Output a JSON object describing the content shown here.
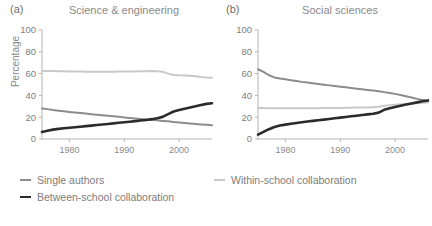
{
  "figure": {
    "background": "#ffffff",
    "axis_color": "#b4b4b4",
    "text_color": "#7e7e7e"
  },
  "legend": {
    "position": "below",
    "items": [
      {
        "label": "Single authors",
        "color": "#8c8c8c",
        "width": 2.0,
        "swatch": "line-swatch-single-authors"
      },
      {
        "label": "Within-school collaboration",
        "color": "#c9c9c9",
        "width": 2.0,
        "swatch": "line-swatch-within-school"
      },
      {
        "label": "Between-school collaboration",
        "color": "#2b2b2b",
        "width": 2.6,
        "swatch": "line-swatch-between-school"
      }
    ]
  },
  "chart_data": [
    {
      "type": "line",
      "panel_tag": "(a)",
      "title": "Science & engineering",
      "xlabel": "",
      "ylabel": "Percentage",
      "xlim": [
        1975,
        2006
      ],
      "ylim": [
        0,
        100
      ],
      "xticks": [
        1980,
        1990,
        2000
      ],
      "xtick_labels": [
        "1980",
        "1990",
        "2000"
      ],
      "yticks": [
        0,
        20,
        40,
        60,
        80,
        100
      ],
      "ytick_labels": [
        "0",
        "20",
        "40",
        "60",
        "80",
        "100"
      ],
      "grid": false,
      "x": [
        1975,
        1976,
        1977,
        1978,
        1979,
        1980,
        1981,
        1982,
        1983,
        1984,
        1985,
        1986,
        1987,
        1988,
        1989,
        1990,
        1991,
        1992,
        1993,
        1994,
        1995,
        1996,
        1997,
        1998,
        1999,
        2000,
        2001,
        2002,
        2003,
        2004,
        2005,
        2006
      ],
      "series": [
        {
          "name": "Within-school collaboration",
          "color": "#c9c9c9",
          "values": [
            62.5,
            62.4,
            62.3,
            62.2,
            62.1,
            62.0,
            62.0,
            61.9,
            61.8,
            61.8,
            61.7,
            61.6,
            61.6,
            61.7,
            61.9,
            62.0,
            62.0,
            62.0,
            62.1,
            62.2,
            62.3,
            62.2,
            61.8,
            60.0,
            58.8,
            58.4,
            58.2,
            58.0,
            57.5,
            56.8,
            56.4,
            56.2
          ]
        },
        {
          "name": "Single authors",
          "color": "#8c8c8c",
          "values": [
            28.0,
            27.4,
            26.6,
            26.0,
            25.4,
            24.8,
            24.3,
            23.8,
            23.3,
            22.8,
            22.3,
            21.8,
            21.3,
            20.8,
            20.3,
            19.8,
            19.3,
            18.8,
            18.3,
            17.9,
            17.5,
            17.1,
            16.6,
            16.2,
            15.7,
            15.2,
            14.7,
            14.2,
            13.8,
            13.4,
            13.0,
            12.6
          ]
        },
        {
          "name": "Between-school collaboration",
          "color": "#2b2b2b",
          "values": [
            6.5,
            7.6,
            8.6,
            9.3,
            9.8,
            10.3,
            10.8,
            11.3,
            11.8,
            12.3,
            12.8,
            13.3,
            13.8,
            14.3,
            14.9,
            15.4,
            15.9,
            16.4,
            16.9,
            17.5,
            18.2,
            19.1,
            20.3,
            22.8,
            25.2,
            26.6,
            27.8,
            29.0,
            30.1,
            31.2,
            32.2,
            32.8
          ]
        }
      ]
    },
    {
      "type": "line",
      "panel_tag": "(b)",
      "title": "Social sciences",
      "xlabel": "",
      "ylabel": "",
      "xlim": [
        1975,
        2006
      ],
      "ylim": [
        0,
        100
      ],
      "xticks": [
        1980,
        1990,
        2000
      ],
      "xtick_labels": [
        "1980",
        "1990",
        "2000"
      ],
      "yticks": [
        0,
        20,
        40,
        60,
        80,
        100
      ],
      "ytick_labels": [
        "0",
        "20",
        "40",
        "60",
        "80",
        "100"
      ],
      "grid": false,
      "x": [
        1975,
        1976,
        1977,
        1978,
        1979,
        1980,
        1981,
        1982,
        1983,
        1984,
        1985,
        1986,
        1987,
        1988,
        1989,
        1990,
        1991,
        1992,
        1993,
        1994,
        1995,
        1996,
        1997,
        1998,
        1999,
        2000,
        2001,
        2002,
        2003,
        2004,
        2005,
        2006
      ],
      "series": [
        {
          "name": "Single authors",
          "color": "#8c8c8c",
          "values": [
            64.0,
            61.5,
            58.5,
            56.5,
            55.5,
            54.8,
            54.0,
            53.2,
            52.4,
            51.8,
            51.2,
            50.5,
            49.8,
            49.2,
            48.6,
            48.0,
            47.4,
            46.8,
            46.2,
            45.6,
            45.0,
            44.4,
            43.8,
            43.0,
            42.2,
            41.4,
            40.4,
            39.3,
            38.0,
            36.8,
            35.8,
            34.8
          ]
        },
        {
          "name": "Within-school collaboration",
          "color": "#c9c9c9",
          "values": [
            28.5,
            28.4,
            28.3,
            28.2,
            28.2,
            28.3,
            28.3,
            28.2,
            28.2,
            28.3,
            28.3,
            28.3,
            28.4,
            28.4,
            28.5,
            28.5,
            28.6,
            28.7,
            28.8,
            28.9,
            29.0,
            29.2,
            29.5,
            30.5,
            31.0,
            31.4,
            31.8,
            32.2,
            32.6,
            32.9,
            33.2,
            33.5
          ]
        },
        {
          "name": "Between-school collaboration",
          "color": "#2b2b2b",
          "values": [
            4.0,
            6.5,
            9.0,
            11.0,
            12.3,
            13.2,
            14.0,
            14.7,
            15.4,
            16.0,
            16.6,
            17.2,
            17.8,
            18.4,
            19.0,
            19.6,
            20.2,
            20.8,
            21.4,
            22.0,
            22.6,
            23.2,
            24.2,
            26.8,
            28.3,
            29.4,
            30.5,
            31.6,
            32.6,
            33.6,
            34.6,
            35.4
          ]
        }
      ]
    }
  ]
}
